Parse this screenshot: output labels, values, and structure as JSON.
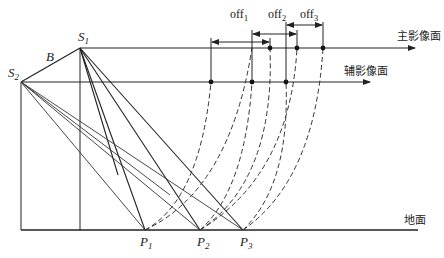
{
  "diagram": {
    "labels": {
      "s1": "S",
      "s1_sub": "1",
      "s2": "S",
      "s2_sub": "2",
      "baseline": "B",
      "p1": "P",
      "p1_sub": "1",
      "p2": "P",
      "p2_sub": "2",
      "p3": "P",
      "p3_sub": "3",
      "off1": "off",
      "off1_sub": "1",
      "off2": "off",
      "off2_sub": "2",
      "off3": "off",
      "off3_sub": "3"
    },
    "planes": {
      "main_image_plane": "主影像面",
      "aux_image_plane": "辅影像面",
      "ground": "地面"
    },
    "colors": {
      "line": "#222222",
      "background": "#ffffff"
    }
  }
}
